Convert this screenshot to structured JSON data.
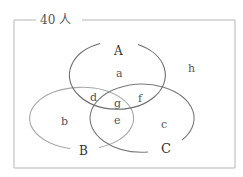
{
  "diagram": {
    "title": "40 人",
    "frame_color": "#b0b0b0",
    "sets": [
      {
        "name": "A",
        "color": "#6e6e6e"
      },
      {
        "name": "B",
        "color": "#a8a8a8"
      },
      {
        "name": "C",
        "color": "#6e6e6e"
      }
    ],
    "regions": {
      "a": "a",
      "b": "b",
      "c": "c",
      "d": "d",
      "e": "e",
      "f": "f",
      "g": "g",
      "h": "h"
    }
  }
}
